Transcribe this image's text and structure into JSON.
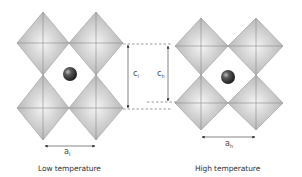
{
  "diagram": {
    "type": "perovskite octahedra lattice comparison",
    "colors": {
      "octahedron_fill": "#c4c4c4",
      "octahedron_highlight": "#f2f2f2",
      "octahedron_edge": "#8a8a8a",
      "cation": "#3a3a3a",
      "dimension_line": "#333333",
      "dashed_guide": "#555555"
    },
    "panels": [
      {
        "id": "low",
        "caption": "Low temperature",
        "lattice_param_a": {
          "symbol": "a",
          "subscript": "l"
        },
        "lattice_param_c": {
          "symbol": "c",
          "subscript": "l"
        }
      },
      {
        "id": "high",
        "caption": "High temperature",
        "lattice_param_a": {
          "symbol": "a",
          "subscript": "h"
        },
        "lattice_param_c": {
          "symbol": "c",
          "subscript": "h"
        }
      }
    ]
  }
}
